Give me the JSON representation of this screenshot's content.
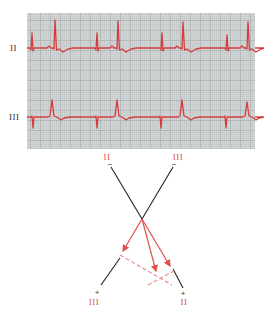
{
  "figure": {
    "type": "ecg-hexaxial-diagram",
    "colors": {
      "grid_bg": "#d3d6d6",
      "grid_minor": "#b9bdbd",
      "grid_major": "#8f9494",
      "trace": "#d63c3c",
      "lead_axis": "#222222",
      "vector": "#e05050",
      "projection": "#e88a8a",
      "axis_label": "#d9534f"
    },
    "strip": {
      "x": 27,
      "y": 13,
      "width": 228,
      "height": 136,
      "leads": [
        {
          "label": "II",
          "baseline_y": 48,
          "label_x": 10,
          "label_y": 51,
          "beats": [
            {
              "p_spike_x": 32,
              "p_spike_top": 33,
              "qrs_x": 55,
              "qrs_top": 20
            },
            {
              "p_spike_x": 97,
              "p_spike_top": 33,
              "qrs_x": 118,
              "qrs_top": 21
            },
            {
              "p_spike_x": 162,
              "p_spike_top": 33,
              "qrs_x": 183,
              "qrs_top": 22
            },
            {
              "p_spike_x": 227,
              "p_spike_top": 35,
              "qrs_x": 248,
              "qrs_top": 22
            }
          ]
        },
        {
          "label": "III",
          "baseline_y": 117,
          "label_x": 9,
          "label_y": 120,
          "beats": [
            {
              "s_spike_x": 33,
              "s_spike_bottom": 128,
              "qrs_x": 52,
              "qrs_top": 100
            },
            {
              "s_spike_x": 97,
              "s_spike_bottom": 128,
              "qrs_x": 117,
              "qrs_top": 100
            },
            {
              "s_spike_x": 161,
              "s_spike_bottom": 128,
              "qrs_x": 182,
              "qrs_top": 100
            },
            {
              "s_spike_x": 226,
              "s_spike_bottom": 128,
              "qrs_x": 247,
              "qrs_top": 102
            }
          ]
        }
      ]
    },
    "diagram": {
      "origin": {
        "x": 142,
        "y": 219
      },
      "lead_axes": [
        {
          "name": "II",
          "neg_label": "II",
          "neg_sign": "−",
          "pos_label": "II",
          "pos_sign": "+",
          "neg_end": {
            "x": 111,
            "y": 167
          },
          "pos_segment": {
            "x1": 173,
            "y1": 269,
            "x2": 183,
            "y2": 288
          },
          "neg_label_pos": {
            "x": 107,
            "y": 160
          },
          "neg_sign_pos": {
            "x": 110,
            "y": 167
          },
          "pos_sign_pos": {
            "x": 183,
            "y": 296
          },
          "pos_label_pos": {
            "x": 184,
            "y": 305
          }
        },
        {
          "name": "III",
          "neg_label": "III",
          "neg_sign": "−",
          "pos_label": "III",
          "pos_sign": "+",
          "neg_end": {
            "x": 173,
            "y": 167
          },
          "pos_segment": {
            "x1": 120,
            "y1": 258,
            "x2": 101,
            "y2": 285
          },
          "neg_label_pos": {
            "x": 178,
            "y": 160
          },
          "neg_sign_pos": {
            "x": 174,
            "y": 167
          },
          "pos_sign_pos": {
            "x": 97,
            "y": 295
          },
          "pos_label_pos": {
            "x": 94,
            "y": 305
          }
        }
      ],
      "vectors": [
        {
          "tip": {
            "x": 123,
            "y": 251
          }
        },
        {
          "tip": {
            "x": 156,
            "y": 271
          }
        },
        {
          "tip": {
            "x": 170,
            "y": 266
          }
        }
      ],
      "projections": [
        {
          "x1": 120,
          "y1": 255,
          "x2": 172,
          "y2": 285
        },
        {
          "x1": 148,
          "y1": 285,
          "x2": 174,
          "y2": 271
        }
      ]
    }
  }
}
